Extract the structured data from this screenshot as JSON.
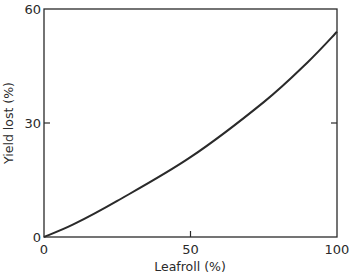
{
  "chart_data": {
    "type": "line",
    "title": "",
    "xlabel": "Leafroll (%)",
    "ylabel": "Yield lost (%)",
    "xlim": [
      0,
      100
    ],
    "ylim": [
      0,
      60
    ],
    "x_ticks": [
      0,
      50,
      100
    ],
    "y_ticks": [
      0,
      30,
      60
    ],
    "x_tick_labels": [
      "0",
      "50",
      "100"
    ],
    "y_tick_labels": [
      "0",
      "30",
      "60"
    ],
    "grid": false,
    "legend": null,
    "series": [
      {
        "name": "Yield lost",
        "color": "#2a2a2a",
        "x": [
          0,
          10,
          25,
          50,
          75,
          90,
          100
        ],
        "y": [
          0,
          3.3,
          9.5,
          21,
          35.5,
          46,
          54
        ]
      }
    ]
  },
  "colors": {
    "axis": "#2a2a2a",
    "line": "#2a2a2a",
    "background": "#ffffff"
  }
}
